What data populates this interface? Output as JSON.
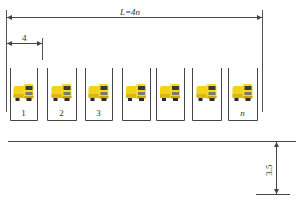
{
  "diagram": {
    "type": "parking-bay-layout",
    "total_length_label": "L=4n",
    "bay_width_label": "4",
    "aisle_width_label": "3.5",
    "colors": {
      "line": "#444444",
      "truck_body": "#f2d21b",
      "truck_shadow": "#c9a70c",
      "truck_dark": "#3a3a3a",
      "background": "#ffffff"
    },
    "bays": [
      {
        "label": "1",
        "icon": "truck-icon"
      },
      {
        "label": "2",
        "icon": "truck-icon"
      },
      {
        "label": "3",
        "icon": "truck-icon"
      },
      {
        "label": "",
        "icon": "truck-icon"
      },
      {
        "label": "",
        "icon": "truck-icon"
      },
      {
        "label": "",
        "icon": "truck-icon"
      },
      {
        "label": "n",
        "icon": "truck-icon"
      }
    ]
  }
}
